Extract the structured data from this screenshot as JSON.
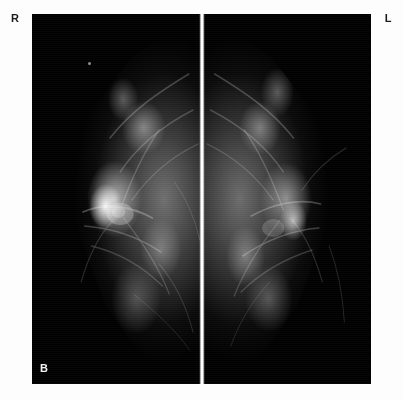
{
  "study": {
    "modality_hint": "mammogram",
    "view": "bilateral"
  },
  "markers": {
    "right_laterality": "R",
    "left_laterality": "L",
    "bottom_marker": "B"
  },
  "panels": [
    {
      "id": "right-breast",
      "side": "R",
      "position": "left"
    },
    {
      "id": "left-breast",
      "side": "L",
      "position": "right"
    }
  ],
  "colors": {
    "background": "#ffffff",
    "film": "#000000",
    "divider": "#ffffff",
    "marker_on_white": "#1b1b1b",
    "marker_on_film": "#f2f2f2"
  }
}
